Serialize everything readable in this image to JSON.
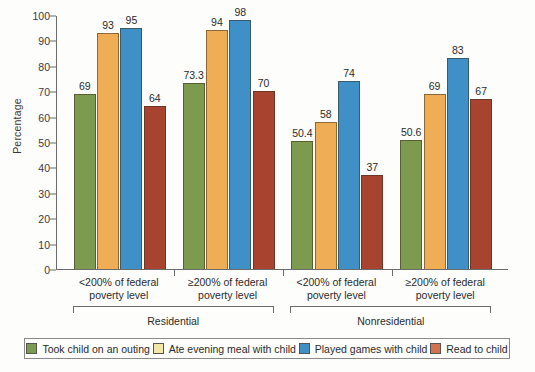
{
  "chart_data": {
    "type": "bar",
    "title": "",
    "xlabel": "",
    "ylabel": "Percentage",
    "ylim": [
      0,
      100
    ],
    "ytick_values": [
      0,
      10,
      20,
      30,
      40,
      50,
      60,
      70,
      80,
      90,
      100
    ],
    "grid": false,
    "legend_position": "bottom",
    "categories": [
      "<200% of federal poverty level",
      "≥200% of federal poverty level",
      "<200% of federal poverty level",
      "≥200% of federal poverty level"
    ],
    "category_lines": [
      [
        "<200% of federal",
        "poverty level"
      ],
      [
        "≥200% of federal",
        "poverty level"
      ],
      [
        "<200% of federal",
        "poverty level"
      ],
      [
        "≥200% of federal",
        "poverty level"
      ]
    ],
    "supergroups": [
      {
        "label": "Residential",
        "categories": [
          0,
          1
        ]
      },
      {
        "label": "Nonresidential",
        "categories": [
          2,
          3
        ]
      }
    ],
    "series": [
      {
        "name": "Took child on an outing",
        "color": "#7d9b4e",
        "values": [
          69,
          73.3,
          50.4,
          50.6
        ],
        "labels": [
          "69",
          "73.3",
          "50.4",
          "50.6"
        ]
      },
      {
        "name": "Ate evening meal with child",
        "color": "#efae55",
        "legend_color": "#f2e6a8",
        "values": [
          93,
          94,
          58,
          69
        ],
        "labels": [
          "93",
          "94",
          "58",
          "69"
        ]
      },
      {
        "name": "Played games with child",
        "color": "#3e90c6",
        "values": [
          95,
          98,
          74,
          83
        ],
        "labels": [
          "95",
          "98",
          "74",
          "83"
        ]
      },
      {
        "name": "Read to child",
        "color": "#a8432f",
        "legend_color": "#d4714f",
        "values": [
          64,
          70,
          37,
          67
        ],
        "labels": [
          "64",
          "70",
          "37",
          "67"
        ]
      }
    ]
  }
}
